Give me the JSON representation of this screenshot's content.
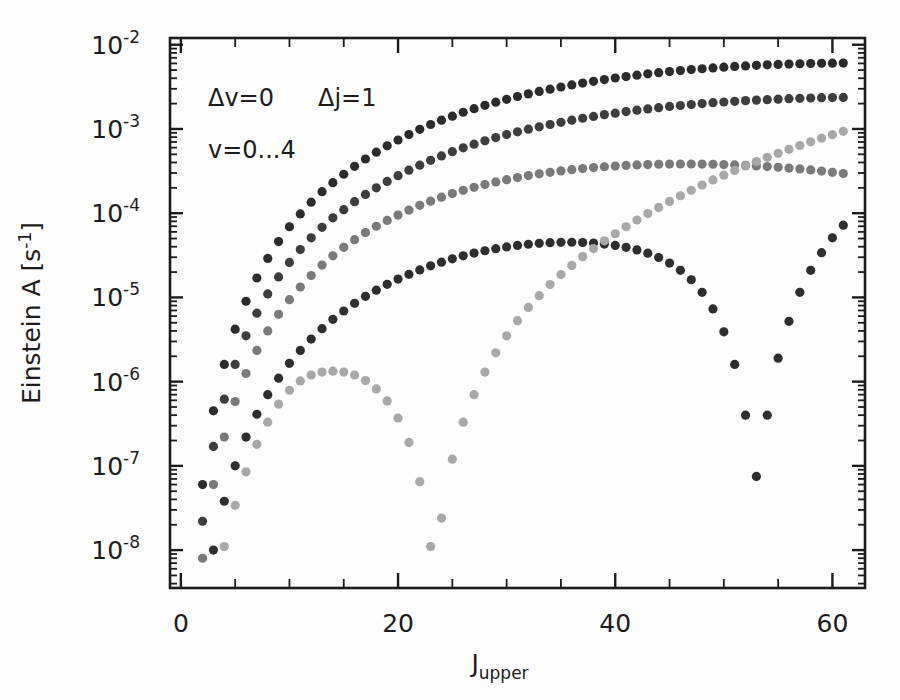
{
  "page_header": {
    "running_head": "",
    "page_number": ""
  },
  "figure": {
    "background_color": "#fdfdfd",
    "frame_color": "#1c1c1c"
  },
  "axes": {
    "x": {
      "label_main": "J",
      "label_sub": "upper",
      "ticks": [
        "0",
        "20",
        "40",
        "60"
      ],
      "tick_values": [
        0,
        20,
        40,
        60
      ],
      "minor_step": 5,
      "range": [
        -1,
        63
      ]
    },
    "y": {
      "label_main": "Einstein A [s",
      "label_exp": "-1",
      "label_close": "]",
      "ticks": [
        "-2",
        "-3",
        "-4",
        "-5",
        "-6",
        "-7",
        "-8"
      ],
      "mantissa": "10",
      "tick_values": [
        -2,
        -3,
        -4,
        -5,
        -6,
        -7,
        -8
      ],
      "range": [
        -8.45,
        -1.92
      ]
    }
  },
  "annotations": {
    "line1_a": "Δv=0",
    "line1_b": "Δj=1",
    "line2": "v=0...4"
  },
  "chart_data": {
    "type": "scatter",
    "title": "",
    "xlabel": "J_upper",
    "ylabel": "Einstein A [s^-1]",
    "xlim": [
      -1,
      63
    ],
    "ylim_log10": [
      -8.45,
      -1.92
    ],
    "yscale": "log",
    "grid": false,
    "legend": false,
    "marker": "filled-circle",
    "marker_size_px": 7,
    "series": [
      {
        "name": "v=0",
        "color": "#2b2b2b",
        "x": [
          2,
          3,
          4,
          5,
          6,
          7,
          8,
          9,
          10,
          11,
          12,
          13,
          14,
          15,
          16,
          17,
          18,
          19,
          20,
          21,
          22,
          23,
          24,
          25,
          26,
          27,
          28,
          29,
          30,
          31,
          32,
          33,
          34,
          35,
          36,
          37,
          38,
          39,
          40,
          41,
          42,
          43,
          44,
          45,
          46,
          47,
          48,
          49,
          50,
          51,
          52,
          53,
          54,
          55,
          56,
          57,
          58,
          59,
          60,
          61
        ],
        "y": [
          6e-08,
          4.5e-07,
          1.6e-06,
          4.2e-06,
          9e-06,
          1.7e-05,
          2.9e-05,
          4.6e-05,
          6.9e-05,
          9.8e-05,
          0.000135,
          0.00018,
          0.00023,
          0.00029,
          0.00036,
          0.00044,
          0.00053,
          0.00063,
          0.00074,
          0.00086,
          0.00099,
          0.00113,
          0.00127,
          0.00142,
          0.00158,
          0.00174,
          0.00191,
          0.00208,
          0.00225,
          0.00243,
          0.00261,
          0.00279,
          0.00297,
          0.00315,
          0.00333,
          0.00351,
          0.00368,
          0.00386,
          0.00403,
          0.00419,
          0.00435,
          0.00451,
          0.00466,
          0.0048,
          0.00494,
          0.00507,
          0.00519,
          0.00531,
          0.00542,
          0.00552,
          0.00561,
          0.0057,
          0.00577,
          0.00584,
          0.0059,
          0.00595,
          0.00599,
          0.00602,
          0.00604,
          0.00605
        ]
      },
      {
        "name": "v=1",
        "color": "#3d3d3d",
        "x": [
          2,
          3,
          4,
          5,
          6,
          7,
          8,
          9,
          10,
          11,
          12,
          13,
          14,
          15,
          16,
          17,
          18,
          19,
          20,
          21,
          22,
          23,
          24,
          25,
          26,
          27,
          28,
          29,
          30,
          31,
          32,
          33,
          34,
          35,
          36,
          37,
          38,
          39,
          40,
          41,
          42,
          43,
          44,
          45,
          46,
          47,
          48,
          49,
          50,
          51,
          52,
          53,
          54,
          55,
          56,
          57,
          58,
          59,
          60,
          61
        ],
        "y": [
          2.2e-08,
          1.7e-07,
          6.2e-07,
          1.6e-06,
          3.5e-06,
          6.5e-06,
          1.1e-05,
          1.75e-05,
          2.6e-05,
          3.7e-05,
          5.1e-05,
          6.8e-05,
          8.8e-05,
          0.00011,
          0.000137,
          0.000167,
          0.0002,
          0.000238,
          0.000279,
          0.000324,
          0.000372,
          0.000424,
          0.000479,
          0.000537,
          0.000597,
          0.00066,
          0.000724,
          0.00079,
          0.000857,
          0.000925,
          0.000993,
          0.00106,
          0.00113,
          0.0012,
          0.00127,
          0.00134,
          0.00141,
          0.00148,
          0.00154,
          0.00161,
          0.00167,
          0.00173,
          0.00179,
          0.00185,
          0.0019,
          0.00195,
          0.002,
          0.00205,
          0.00209,
          0.00213,
          0.00217,
          0.0022,
          0.00223,
          0.00226,
          0.00229,
          0.00231,
          0.00233,
          0.00235,
          0.00236,
          0.00237
        ]
      },
      {
        "name": "v=2",
        "color": "#7a7a7a",
        "x": [
          2,
          3,
          4,
          5,
          6,
          7,
          8,
          9,
          10,
          11,
          12,
          13,
          14,
          15,
          16,
          17,
          18,
          19,
          20,
          21,
          22,
          23,
          24,
          25,
          26,
          27,
          28,
          29,
          30,
          31,
          32,
          33,
          34,
          35,
          36,
          37,
          38,
          39,
          40,
          41,
          42,
          43,
          44,
          45,
          46,
          47,
          48,
          49,
          50,
          51,
          52,
          53,
          54,
          55,
          56,
          57,
          58,
          59,
          60,
          61
        ],
        "y": [
          8e-09,
          6e-08,
          2.2e-07,
          5.8e-07,
          1.25e-06,
          2.35e-06,
          4e-06,
          6.3e-06,
          9.4e-06,
          1.33e-05,
          1.82e-05,
          2.42e-05,
          3.12e-05,
          3.93e-05,
          4.85e-05,
          5.88e-05,
          7e-05,
          8.2e-05,
          9.5e-05,
          0.000109,
          0.000124,
          0.000139,
          0.000155,
          0.000171,
          0.000187,
          0.000203,
          0.000219,
          0.000235,
          0.00025,
          0.000265,
          0.00028,
          0.000293,
          0.000306,
          0.000318,
          0.000329,
          0.000339,
          0.000348,
          0.000356,
          0.000363,
          0.000369,
          0.000374,
          0.000378,
          0.000381,
          0.000383,
          0.000384,
          0.000384,
          0.000383,
          0.000381,
          0.000378,
          0.000374,
          0.00037,
          0.000364,
          0.000358,
          0.000351,
          0.000343,
          0.000335,
          0.000326,
          0.000316,
          0.000306,
          0.000296
        ]
      },
      {
        "name": "v=3",
        "color": "#2e2e2e",
        "x": [
          2,
          3,
          4,
          5,
          6,
          7,
          8,
          9,
          10,
          11,
          12,
          13,
          14,
          15,
          16,
          17,
          18,
          19,
          20,
          21,
          22,
          23,
          24,
          25,
          26,
          27,
          28,
          29,
          30,
          31,
          32,
          33,
          34,
          35,
          36,
          37,
          38,
          39,
          40,
          41,
          42,
          43,
          44,
          45,
          46,
          47,
          48,
          49,
          50,
          51,
          52,
          53,
          54,
          55,
          56,
          57,
          58,
          59,
          60,
          61
        ],
        "y": [
          1.4e-09,
          1e-08,
          3.8e-08,
          1e-07,
          2.2e-07,
          4.1e-07,
          7e-07,
          1.1e-06,
          1.65e-06,
          2.35e-06,
          3.2e-06,
          4.25e-06,
          5.5e-06,
          6.9e-06,
          8.5e-06,
          1.03e-05,
          1.22e-05,
          1.43e-05,
          1.65e-05,
          1.88e-05,
          2.12e-05,
          2.37e-05,
          2.62e-05,
          2.87e-05,
          3.12e-05,
          3.36e-05,
          3.58e-05,
          3.79e-05,
          3.98e-05,
          4.14e-05,
          4.28e-05,
          4.39e-05,
          4.47e-05,
          4.51e-05,
          4.52e-05,
          4.49e-05,
          4.42e-05,
          4.3e-05,
          4.14e-05,
          3.93e-05,
          3.66e-05,
          3.35e-05,
          2.98e-05,
          2.56e-05,
          2.1e-05,
          1.62e-05,
          1.15e-05,
          7.3e-06,
          3.9e-06,
          1.6e-06,
          4e-07,
          7.5e-08,
          4e-07,
          1.9e-06,
          5.2e-06,
          1.15e-05,
          2.1e-05,
          3.4e-05,
          5.1e-05,
          7.2e-05
        ]
      },
      {
        "name": "v=4",
        "color": "#a8a8a8",
        "x": [
          2,
          3,
          4,
          5,
          6,
          7,
          8,
          9,
          10,
          11,
          12,
          13,
          14,
          15,
          16,
          17,
          18,
          19,
          20,
          21,
          22,
          23,
          24,
          25,
          26,
          27,
          28,
          29,
          30,
          31,
          32,
          33,
          34,
          35,
          36,
          37,
          38,
          39,
          40,
          41,
          42,
          43,
          44,
          45,
          46,
          47,
          48,
          49,
          50,
          51,
          52,
          53,
          54,
          55,
          56,
          57,
          58,
          59,
          60,
          61
        ],
        "y": [
          5e-10,
          2.6e-09,
          1.1e-08,
          3.4e-08,
          8.5e-08,
          1.8e-07,
          3.3e-07,
          5.4e-07,
          7.9e-07,
          1.02e-06,
          1.2e-06,
          1.3e-06,
          1.33e-06,
          1.3e-06,
          1.2e-06,
          1.03e-06,
          8.2e-07,
          5.9e-07,
          3.7e-07,
          1.9e-07,
          6.5e-08,
          1.1e-08,
          2.4e-08,
          1.2e-07,
          3.3e-07,
          7e-07,
          1.3e-06,
          2.2e-06,
          3.5e-06,
          5.3e-06,
          7.6e-06,
          1.05e-05,
          1.42e-05,
          1.87e-05,
          2.4e-05,
          3.05e-05,
          3.8e-05,
          4.7e-05,
          5.7e-05,
          6.9e-05,
          8.3e-05,
          9.9e-05,
          0.000117,
          0.000138,
          0.000161,
          0.000187,
          0.000216,
          0.000248,
          0.000283,
          0.000322,
          0.000364,
          0.00041,
          0.00046,
          0.000514,
          0.000573,
          0.000636,
          0.000704,
          0.000777,
          0.000855,
          0.000938
        ]
      }
    ]
  }
}
